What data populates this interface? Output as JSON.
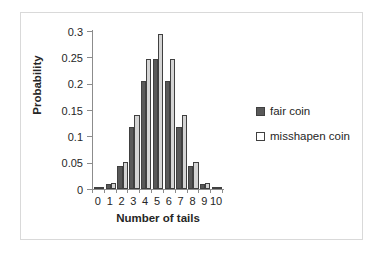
{
  "chart_data": {
    "type": "bar",
    "title": "",
    "subtitle": "",
    "xlabel": "Number of tails",
    "ylabel": "Probability",
    "categories": [
      "0",
      "1",
      "2",
      "3",
      "4",
      "5",
      "6",
      "7",
      "8",
      "9",
      "10"
    ],
    "series": [
      {
        "name": "fair coin",
        "color": "#595959",
        "values": [
          0.001,
          0.0098,
          0.044,
          0.117,
          0.205,
          0.246,
          0.205,
          0.117,
          0.044,
          0.0098,
          0.001
        ]
      },
      {
        "name": "misshapen coin",
        "color": "#d4d4d4",
        "values": [
          0.002,
          0.011,
          0.052,
          0.14,
          0.246,
          0.295,
          0.246,
          0.14,
          0.052,
          0.011,
          0.002
        ]
      }
    ],
    "ylim": [
      0,
      0.3
    ],
    "ytick_labels": [
      "0",
      "0.05",
      "0.1",
      "0.15",
      "0.2",
      "0.25",
      "0.3"
    ],
    "ytick_values": [
      0,
      0.05,
      0.1,
      0.15,
      0.2,
      0.25,
      0.3
    ],
    "xlim": [
      -0.5,
      10.5
    ],
    "grid": false,
    "legend_position": "right",
    "legend_entries": [
      "fair coin",
      "misshapen coin"
    ],
    "annotations": []
  },
  "legend": {
    "items": [
      {
        "label": "fair coin",
        "swatch": "legend-swatch-fair-coin"
      },
      {
        "label": "misshapen coin",
        "swatch": "legend-swatch-misshapen-coin"
      }
    ]
  }
}
